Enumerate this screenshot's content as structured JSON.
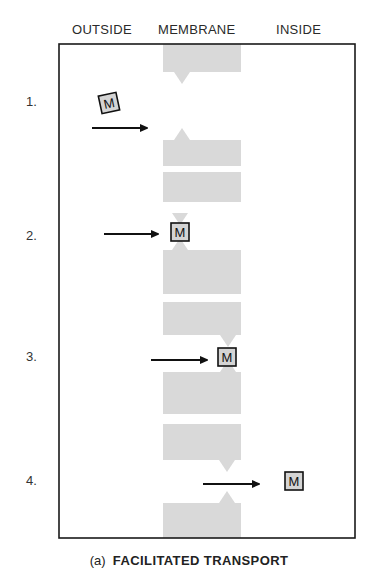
{
  "header": {
    "columns": [
      {
        "label": "OUTSIDE",
        "x": 72
      },
      {
        "label": "MEMBRANE",
        "x": 158
      },
      {
        "label": "INSIDE",
        "x": 276
      }
    ]
  },
  "frame": {
    "x": 59,
    "y": 44,
    "width": 296,
    "height": 494,
    "stroke": "#1a1a1a"
  },
  "membrane": {
    "x": 163,
    "width": 78,
    "fill": "#d9d9d9"
  },
  "steps": [
    {
      "label": "1.",
      "label_y": 94,
      "channel_x": 182,
      "gap_top": 72,
      "gap_bottom": 140,
      "molecule": {
        "text": "M",
        "x": 100,
        "y": 94,
        "rotate": -12
      },
      "arrow": {
        "x1": 92,
        "x2": 146,
        "y": 128
      }
    },
    {
      "label": "2.",
      "label_y": 228,
      "channel_x": 180,
      "gap_top": 213,
      "gap_bottom": 250,
      "molecule": {
        "text": "M",
        "x": 171,
        "y": 223,
        "rotate": 0
      },
      "arrow": {
        "x1": 104,
        "x2": 157,
        "y": 234
      }
    },
    {
      "label": "3.",
      "label_y": 349,
      "channel_x": 228,
      "gap_top": 335,
      "gap_bottom": 372,
      "molecule": {
        "text": "M",
        "x": 218,
        "y": 348,
        "rotate": 0
      },
      "arrow": {
        "x1": 151,
        "x2": 206,
        "y": 360
      }
    },
    {
      "label": "4.",
      "label_y": 473,
      "channel_x": 227,
      "gap_top": 460,
      "gap_bottom": 503,
      "molecule": {
        "text": "M",
        "x": 285,
        "y": 472,
        "rotate": 0
      },
      "arrow": {
        "x1": 203,
        "x2": 258,
        "y": 484
      }
    }
  ],
  "membrane_blocks": [
    {
      "y": 44,
      "h": 28
    },
    {
      "y": 140,
      "h": 26
    },
    {
      "y": 172,
      "h": 30
    },
    {
      "y": 250,
      "h": 44
    },
    {
      "y": 302,
      "h": 33
    },
    {
      "y": 372,
      "h": 42
    },
    {
      "y": 424,
      "h": 36
    },
    {
      "y": 503,
      "h": 35
    }
  ],
  "caption": {
    "tag": "(a)",
    "title": "FACILITATED TRANSPORT"
  },
  "colors": {
    "molecule_fill": "#d4d4d4",
    "molecule_stroke": "#111111",
    "arrow": "#111111"
  }
}
